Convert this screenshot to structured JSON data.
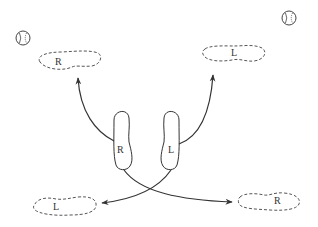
{
  "diagram": {
    "title": "",
    "colors": {
      "stroke": "#333333",
      "dashed": "#555555",
      "background": "#ffffff"
    },
    "icons": [
      {
        "name": "baseball-icon",
        "position": "top-left"
      },
      {
        "name": "baseball-icon",
        "position": "top-right"
      }
    ],
    "footprints": {
      "top_left": {
        "label": "R",
        "style": "dashed"
      },
      "top_right": {
        "label": "L",
        "style": "dashed"
      },
      "bottom_left": {
        "label": "L",
        "style": "dashed"
      },
      "bottom_right": {
        "label": "R",
        "style": "dashed"
      }
    },
    "feet": {
      "right": {
        "label": "R",
        "style": "solid"
      },
      "left": {
        "label": "L",
        "style": "solid"
      }
    },
    "arrows": [
      {
        "from": "right-foot",
        "to": "top-left-footprint"
      },
      {
        "from": "left-foot",
        "to": "top-right-footprint"
      },
      {
        "from": "right-foot",
        "to": "bottom-right-footprint"
      },
      {
        "from": "left-foot",
        "to": "bottom-left-footprint"
      }
    ]
  }
}
